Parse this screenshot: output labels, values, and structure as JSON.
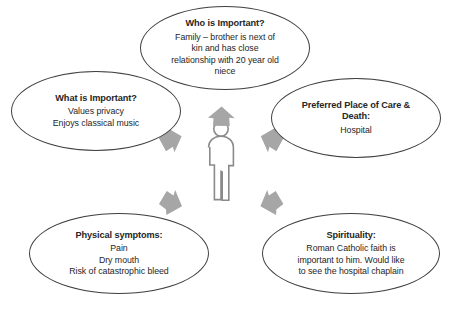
{
  "diagram": {
    "center": {
      "figure_icon": "person-icon",
      "arrow_icon": "arrow-outward-icon",
      "arrow_color": "#a6a6a6",
      "figure_color": "#808080"
    },
    "bubble_border_color": "#3f3f3f",
    "bubbles": [
      {
        "id": "who",
        "title": "Who is Important?",
        "body": "Family – brother is next of kin and has close relationship with 20 year old niece",
        "lines": []
      },
      {
        "id": "what",
        "title": "What is Important?",
        "body": "",
        "lines": [
          "Values privacy",
          "Enjoys classical music"
        ]
      },
      {
        "id": "place",
        "title": "Preferred Place of Care & Death:",
        "body": "",
        "lines": [
          "Hospital"
        ]
      },
      {
        "id": "physical",
        "title": "Physical symptoms:",
        "body": "",
        "lines": [
          "Pain",
          "Dry mouth",
          "Risk of catastrophic bleed"
        ]
      },
      {
        "id": "spirituality",
        "title": "Spirituality:",
        "body": "Roman Catholic faith is important to him. Would like to see the hospital chaplain",
        "lines": []
      }
    ],
    "caption": ""
  }
}
